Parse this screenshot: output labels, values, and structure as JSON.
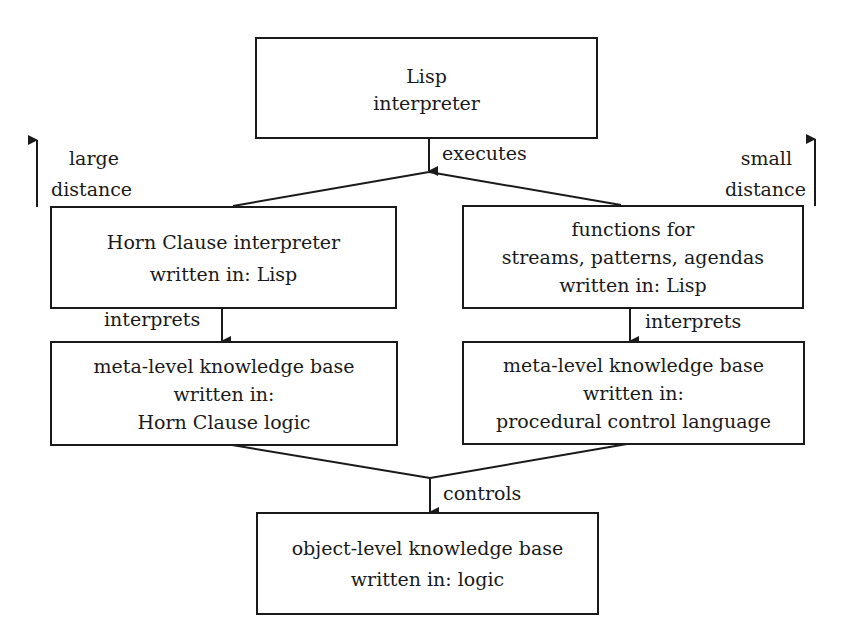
{
  "diagram": {
    "nodes": {
      "lisp_interpreter": {
        "lines": [
          "Lisp",
          "interpreter"
        ]
      },
      "horn_interpreter": {
        "lines": [
          "Horn Clause interpreter",
          "written in: Lisp"
        ]
      },
      "functions": {
        "lines": [
          "functions for",
          "streams, patterns, agendas",
          "written in: Lisp"
        ]
      },
      "meta_horn": {
        "lines": [
          "meta-level knowledge base",
          "written in:",
          "Horn Clause logic"
        ]
      },
      "meta_procedural": {
        "lines": [
          "meta-level knowledge base",
          "written in:",
          "procedural control language"
        ]
      },
      "object_level": {
        "lines": [
          "object-level knowledge base",
          "written in: logic"
        ]
      }
    },
    "edges": {
      "executes": "executes",
      "interprets_left": "interprets",
      "interprets_right": "interprets",
      "controls": "controls"
    },
    "side_labels": {
      "left": [
        "large",
        "distance"
      ],
      "right": [
        "small",
        "distance"
      ]
    }
  }
}
